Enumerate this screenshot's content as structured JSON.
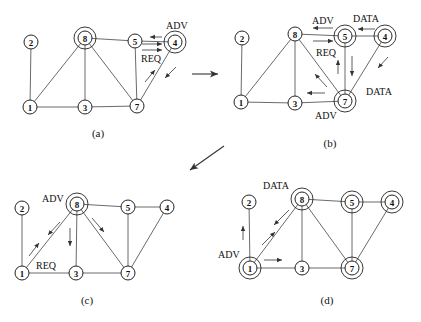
{
  "figure": {
    "title": "",
    "edges": [
      [
        1,
        2
      ],
      [
        1,
        8
      ],
      [
        1,
        3
      ],
      [
        8,
        3
      ],
      [
        8,
        5
      ],
      [
        8,
        7
      ],
      [
        3,
        7
      ],
      [
        5,
        7
      ],
      [
        5,
        4
      ],
      [
        4,
        7
      ]
    ],
    "panels": [
      {
        "id": "a",
        "caption": "(a)",
        "caption_pos": [
          98,
          137
        ],
        "nodes": {
          "1": {
            "x": 30,
            "y": 107,
            "ring": false
          },
          "2": {
            "x": 31,
            "y": 42,
            "ring": false
          },
          "3": {
            "x": 85,
            "y": 107,
            "ring": false
          },
          "4": {
            "x": 175,
            "y": 42,
            "ring": true
          },
          "5": {
            "x": 135,
            "y": 41,
            "ring": false
          },
          "7": {
            "x": 137,
            "y": 106,
            "ring": false
          },
          "8": {
            "x": 85,
            "y": 38,
            "ring": true
          }
        },
        "labels": [
          {
            "text": "ADV",
            "x": 166,
            "y": 29
          },
          {
            "text": "REQ",
            "x": 141,
            "y": 62
          }
        ],
        "arrows": [
          {
            "x1": 162,
            "y1": 37,
            "x2": 150,
            "y2": 37
          },
          {
            "x1": 142,
            "y1": 44,
            "x2": 162,
            "y2": 44
          },
          {
            "x1": 142,
            "y1": 50,
            "x2": 162,
            "y2": 50
          },
          {
            "x1": 145,
            "y1": 82,
            "x2": 155,
            "y2": 70
          },
          {
            "x1": 176,
            "y1": 67,
            "x2": 165,
            "y2": 78
          }
        ]
      },
      {
        "id": "b",
        "caption": "(b)",
        "caption_pos": [
          330,
          147
        ],
        "nodes": {
          "1": {
            "x": 241,
            "y": 102,
            "ring": false
          },
          "2": {
            "x": 242,
            "y": 38,
            "ring": false
          },
          "3": {
            "x": 295,
            "y": 103,
            "ring": false
          },
          "4": {
            "x": 385,
            "y": 36,
            "ring": true
          },
          "5": {
            "x": 345,
            "y": 36,
            "ring": true
          },
          "7": {
            "x": 345,
            "y": 101,
            "ring": true
          },
          "8": {
            "x": 295,
            "y": 34,
            "ring": false
          }
        },
        "labels": [
          {
            "text": "ADV",
            "x": 312,
            "y": 24
          },
          {
            "text": "DATA",
            "x": 353,
            "y": 22
          },
          {
            "text": "REQ",
            "x": 316,
            "y": 56
          },
          {
            "text": "DATA",
            "x": 366,
            "y": 95
          },
          {
            "text": "ADV",
            "x": 315,
            "y": 119
          }
        ],
        "arrows": [
          {
            "x1": 333,
            "y1": 28,
            "x2": 313,
            "y2": 28
          },
          {
            "x1": 313,
            "y1": 41,
            "x2": 333,
            "y2": 41
          },
          {
            "x1": 375,
            "y1": 29,
            "x2": 358,
            "y2": 29
          },
          {
            "x1": 338,
            "y1": 74,
            "x2": 338,
            "y2": 60
          },
          {
            "x1": 352,
            "y1": 56,
            "x2": 352,
            "y2": 76
          },
          {
            "x1": 327,
            "y1": 87,
            "x2": 315,
            "y2": 74
          },
          {
            "x1": 325,
            "y1": 93,
            "x2": 307,
            "y2": 93
          },
          {
            "x1": 388,
            "y1": 57,
            "x2": 378,
            "y2": 68
          }
        ]
      },
      {
        "id": "c",
        "caption": "(c)",
        "caption_pos": [
          87,
          304
        ],
        "nodes": {
          "1": {
            "x": 22,
            "y": 273,
            "ring": false
          },
          "2": {
            "x": 22,
            "y": 208,
            "ring": false
          },
          "3": {
            "x": 76,
            "y": 273,
            "ring": false
          },
          "4": {
            "x": 167,
            "y": 207,
            "ring": false
          },
          "5": {
            "x": 128,
            "y": 207,
            "ring": false
          },
          "7": {
            "x": 128,
            "y": 273,
            "ring": false
          },
          "8": {
            "x": 77,
            "y": 204,
            "ring": true
          }
        },
        "labels": [
          {
            "text": "ADV",
            "x": 42,
            "y": 202
          },
          {
            "text": "REQ",
            "x": 36,
            "y": 269
          }
        ],
        "arrows": [
          {
            "x1": 60,
            "y1": 222,
            "x2": 48,
            "y2": 235
          },
          {
            "x1": 29,
            "y1": 256,
            "x2": 39,
            "y2": 243
          },
          {
            "x1": 70,
            "y1": 228,
            "x2": 70,
            "y2": 246
          },
          {
            "x1": 92,
            "y1": 218,
            "x2": 104,
            "y2": 232
          }
        ]
      },
      {
        "id": "d",
        "caption": "(d)",
        "caption_pos": [
          327,
          304
        ],
        "nodes": {
          "1": {
            "x": 250,
            "y": 268,
            "ring": true
          },
          "2": {
            "x": 249,
            "y": 202,
            "ring": false
          },
          "3": {
            "x": 302,
            "y": 268,
            "ring": false
          },
          "4": {
            "x": 392,
            "y": 202,
            "ring": true
          },
          "5": {
            "x": 352,
            "y": 202,
            "ring": true
          },
          "7": {
            "x": 352,
            "y": 268,
            "ring": true
          },
          "8": {
            "x": 302,
            "y": 199,
            "ring": true
          }
        },
        "labels": [
          {
            "text": "DATA",
            "x": 263,
            "y": 189
          },
          {
            "text": "ADV",
            "x": 218,
            "y": 258
          }
        ],
        "arrows": [
          {
            "x1": 289,
            "y1": 210,
            "x2": 274,
            "y2": 225
          },
          {
            "x1": 262,
            "y1": 245,
            "x2": 275,
            "y2": 232
          },
          {
            "x1": 243,
            "y1": 240,
            "x2": 243,
            "y2": 226
          },
          {
            "x1": 264,
            "y1": 260,
            "x2": 282,
            "y2": 260
          }
        ]
      }
    ],
    "transitions": [
      {
        "name": "a-to-b",
        "x1": 192,
        "y1": 74,
        "x2": 218,
        "y2": 74
      },
      {
        "name": "b-to-c",
        "x1": 224,
        "y1": 146,
        "x2": 190,
        "y2": 170
      }
    ],
    "style": {
      "node_radius": 7,
      "ring_radius": 11,
      "line_color": "#444444"
    }
  }
}
